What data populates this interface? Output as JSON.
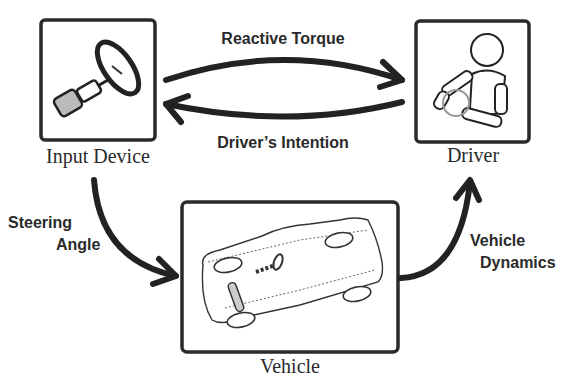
{
  "diagram": {
    "nodes": [
      {
        "id": "input_device",
        "label": "Input Device",
        "icon": "steering-wheel-icon"
      },
      {
        "id": "driver",
        "label": "Driver",
        "icon": "crash-dummy-driver-icon"
      },
      {
        "id": "vehicle",
        "label": "Vehicle",
        "icon": "car-top-view-icon"
      }
    ],
    "edges": [
      {
        "from": "input_device",
        "to": "driver",
        "label": "Reactive Torque"
      },
      {
        "from": "driver",
        "to": "input_device",
        "label": "Driver’s Intention"
      },
      {
        "from": "input_device",
        "to": "vehicle",
        "label_line1": "Steering",
        "label_line2": "Angle"
      },
      {
        "from": "vehicle",
        "to": "driver",
        "label_line1": "Vehicle",
        "label_line2": "Dynamics"
      }
    ]
  }
}
